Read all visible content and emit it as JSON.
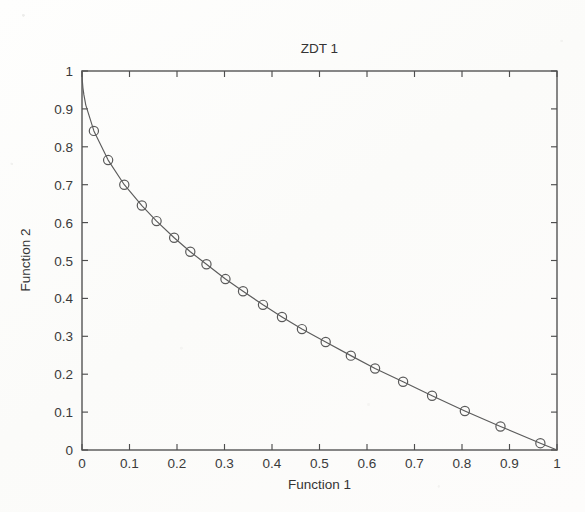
{
  "figure": {
    "title": "ZDT 1",
    "background_color": "#fdfcfb",
    "axis_color": "#4e4e4e",
    "line_color": "#5c5c5c",
    "marker_color": "#5a5a5a"
  },
  "chart_data": {
    "type": "line",
    "title": "ZDT 1",
    "xlabel": "Function 1",
    "ylabel": "Function 2",
    "xlim": [
      0,
      1
    ],
    "ylim": [
      0,
      1
    ],
    "grid": false,
    "legend": null,
    "marker": "circle-open",
    "x_ticks": [
      "0",
      "0.1",
      "0.2",
      "0.3",
      "0.4",
      "0.5",
      "0.6",
      "0.7",
      "0.8",
      "0.9",
      "1"
    ],
    "y_ticks": [
      "0",
      "0.1",
      "0.2",
      "0.3",
      "0.4",
      "0.5",
      "0.6",
      "0.7",
      "0.8",
      "0.9",
      "1"
    ],
    "x_tick_values": [
      0,
      0.1,
      0.2,
      0.3,
      0.4,
      0.5,
      0.6,
      0.7,
      0.8,
      0.9,
      1
    ],
    "y_tick_values": [
      0,
      0.1,
      0.2,
      0.3,
      0.4,
      0.5,
      0.6,
      0.7,
      0.8,
      0.9,
      1
    ],
    "series": [
      {
        "name": "Pareto front",
        "x": [
          0.0,
          0.0007,
          0.002,
          0.004,
          0.008,
          0.025,
          0.055,
          0.089,
          0.126,
          0.157,
          0.194,
          0.228,
          0.262,
          0.302,
          0.339,
          0.381,
          0.421,
          0.463,
          0.513,
          0.566,
          0.617,
          0.676,
          0.737,
          0.806,
          0.881,
          0.965,
          1.0
        ],
        "y": [
          1.0,
          0.974,
          0.955,
          0.937,
          0.91,
          0.842,
          0.765,
          0.7,
          0.645,
          0.604,
          0.56,
          0.523,
          0.49,
          0.451,
          0.419,
          0.383,
          0.351,
          0.319,
          0.285,
          0.249,
          0.215,
          0.18,
          0.143,
          0.103,
          0.062,
          0.018,
          0.0
        ]
      }
    ],
    "markers_x": [
      0.025,
      0.055,
      0.089,
      0.126,
      0.157,
      0.194,
      0.228,
      0.262,
      0.302,
      0.339,
      0.381,
      0.421,
      0.463,
      0.513,
      0.566,
      0.617,
      0.676,
      0.737,
      0.806,
      0.881,
      0.965
    ],
    "markers_y": [
      0.842,
      0.765,
      0.7,
      0.645,
      0.604,
      0.56,
      0.523,
      0.49,
      0.451,
      0.419,
      0.383,
      0.351,
      0.319,
      0.285,
      0.249,
      0.215,
      0.18,
      0.143,
      0.103,
      0.062,
      0.018
    ]
  }
}
